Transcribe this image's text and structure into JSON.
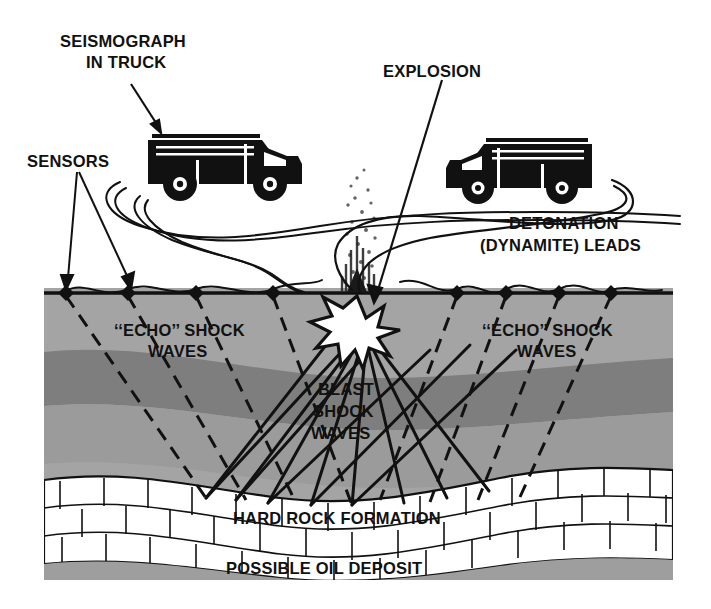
{
  "figure": {
    "background_color": "#ffffff"
  },
  "labels": {
    "seismograph_line1": "SEISMOGRAPH",
    "seismograph_line2": "IN TRUCK",
    "sensors": "SENSORS",
    "explosion": "EXPLOSION",
    "detonation_line1": "DETONATION",
    "detonation_line2": "(DYNAMITE) LEADS",
    "echo_left_line1": "‘‘ECHO’’ SHOCK",
    "echo_left_line2": "WAVES",
    "echo_right_line1": "‘‘ECHO’’ SHOCK",
    "echo_right_line2": "WAVES",
    "blast_line1": "BLAST",
    "blast_line2": "SHOCK",
    "blast_line3": "WAVES",
    "hard_rock": "HARD ROCK FORMATION",
    "oil_deposit": "POSSIBLE OIL DEPOSIT"
  },
  "colors": {
    "ink": "#111111",
    "surface_soil": "#9e9e9e",
    "layer_light": "#a8a8a8",
    "layer_dark": "#7e7e7e",
    "layer_mid": "#9e9e9e",
    "rock_fill": "#ffffff",
    "oil_fill": "#9e9e9e",
    "sky": "#ffffff"
  },
  "geology": {
    "layers": [
      {
        "name": "topsoil",
        "label": "surface soil",
        "shade": "#a4a4a4"
      },
      {
        "name": "dark-band",
        "label": "dark sediment band",
        "shade": "#7e7e7e"
      },
      {
        "name": "mid-band",
        "label": "sediment",
        "shade": "#9e9e9e"
      },
      {
        "name": "hard-rock",
        "label": "HARD ROCK FORMATION",
        "shade": "#ffffff"
      },
      {
        "name": "oil-zone",
        "label": "POSSIBLE OIL DEPOSIT",
        "shade": "#9e9e9e"
      }
    ]
  },
  "sensors": {
    "count": 8,
    "left_group_x": [
      66,
      128,
      196,
      273
    ],
    "right_group_x": [
      457,
      506,
      559,
      611
    ],
    "surface_y": 293
  },
  "explosion": {
    "x": 357,
    "y": 330,
    "points": 12,
    "debris_plume": true
  },
  "trucks": [
    {
      "name": "seismograph-truck",
      "facing": "right",
      "x": 140,
      "y": 128
    },
    {
      "name": "shot-truck",
      "facing": "left",
      "x": 470,
      "y": 132
    }
  ],
  "waves": {
    "blast_style": "solid",
    "echo_style": "dashed",
    "blast_ray_count": 8,
    "echo_ray_count": 8
  }
}
